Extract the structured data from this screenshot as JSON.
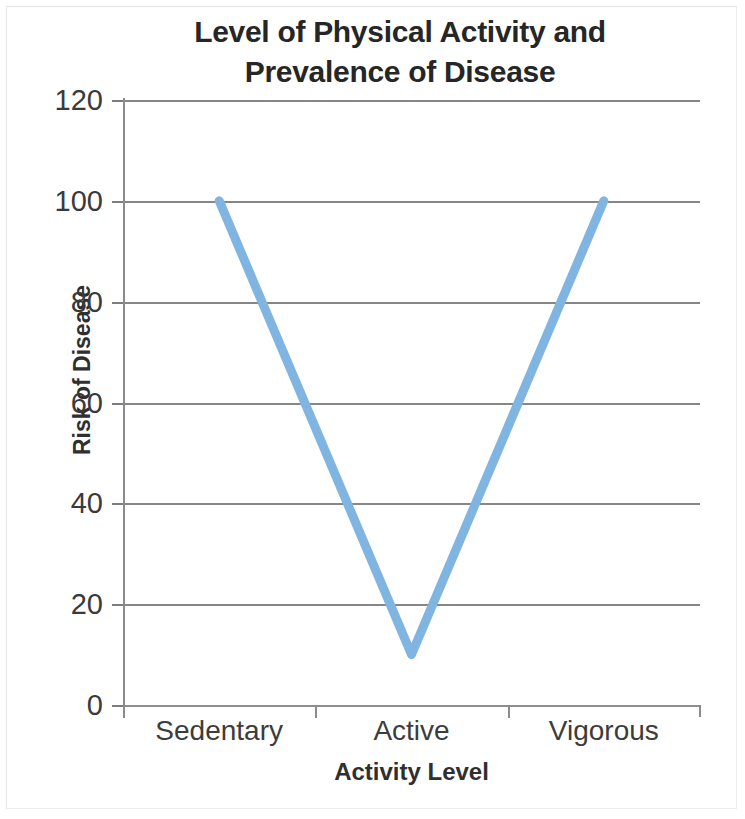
{
  "chart_data": {
    "type": "line",
    "title": "Level of Physical Activity and Prevalence of Disease",
    "title_lines": [
      "Level of Physical Activity and",
      "Prevalence of Disease"
    ],
    "xlabel": "Activity Level",
    "ylabel": "Risk of Disease",
    "categories": [
      "Sedentary",
      "Active",
      "Vigorous"
    ],
    "values": [
      100,
      10,
      100
    ],
    "series": [
      {
        "name": "Risk of Disease",
        "values": [
          100,
          10,
          100
        ],
        "color": "#7fb5e0"
      }
    ],
    "ylim": [
      0,
      120
    ],
    "ytick_labels": [
      "0",
      "20",
      "40",
      "60",
      "80",
      "100",
      "120"
    ],
    "ytick_values": [
      0,
      20,
      40,
      60,
      80,
      100,
      120
    ],
    "grid": true,
    "legend": "none",
    "line_color": "#7fb5e0",
    "axis_color": "#868686"
  }
}
